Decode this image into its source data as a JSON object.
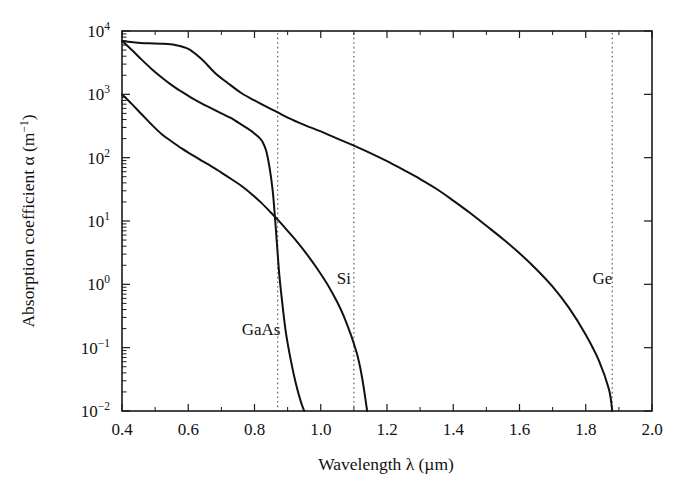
{
  "chart_data": {
    "type": "line",
    "title": "",
    "xlabel": "Wavelength λ (µm)",
    "ylabel": "Absorption coefficient α (m⁻¹)",
    "xlim": [
      0.4,
      2.0
    ],
    "ylim": [
      0.01,
      10000
    ],
    "yscale": "log",
    "xscale": "linear",
    "grid": false,
    "legend": "inline-labels",
    "xticks": [
      "0.4",
      "0.6",
      "0.8",
      "1.0",
      "1.2",
      "1.4",
      "1.6",
      "1.8",
      "2.0"
    ],
    "xtick_values": [
      0.4,
      0.6,
      0.8,
      1.0,
      1.2,
      1.4,
      1.6,
      1.8,
      2.0
    ],
    "yticks": [
      "10⁴",
      "10³",
      "10²",
      "10¹",
      "10⁰",
      "10⁻¹",
      "10⁻²"
    ],
    "ytick_bases": [
      "10",
      "10",
      "10",
      "10",
      "10",
      "10",
      "10"
    ],
    "ytick_exponents": [
      "4",
      "3",
      "2",
      "1",
      "0",
      "-1",
      "-2"
    ],
    "ytick_values": [
      10000,
      1000,
      100,
      10,
      1,
      0.1,
      0.01
    ],
    "annotations": [
      {
        "text": "GaAs",
        "x": 0.82,
        "y": 0.16,
        "kind": "curve-label"
      },
      {
        "text": "Si",
        "x": 1.07,
        "y": 1.0,
        "kind": "curve-label"
      },
      {
        "text": "Ge",
        "x": 1.85,
        "y": 1.0,
        "kind": "curve-label"
      }
    ],
    "bandgap_cutoffs": [
      {
        "material": "GaAs",
        "wavelength": 0.87
      },
      {
        "material": "Si",
        "wavelength": 1.1
      },
      {
        "material": "Ge",
        "wavelength": 1.88
      }
    ],
    "series": [
      {
        "name": "Ge",
        "points": [
          [
            0.4,
            7000
          ],
          [
            0.44,
            6600
          ],
          [
            0.48,
            6400
          ],
          [
            0.52,
            6300
          ],
          [
            0.56,
            6000
          ],
          [
            0.6,
            5200
          ],
          [
            0.64,
            3600
          ],
          [
            0.68,
            2200
          ],
          [
            0.72,
            1500
          ],
          [
            0.76,
            1050
          ],
          [
            0.8,
            800
          ],
          [
            0.84,
            620
          ],
          [
            0.87,
            520
          ],
          [
            0.9,
            430
          ],
          [
            0.95,
            330
          ],
          [
            1.0,
            260
          ],
          [
            1.05,
            200
          ],
          [
            1.1,
            155
          ],
          [
            1.15,
            118
          ],
          [
            1.2,
            88
          ],
          [
            1.25,
            64
          ],
          [
            1.3,
            46
          ],
          [
            1.35,
            32
          ],
          [
            1.4,
            21
          ],
          [
            1.45,
            13.5
          ],
          [
            1.5,
            8.4
          ],
          [
            1.55,
            5.2
          ],
          [
            1.6,
            3.1
          ],
          [
            1.65,
            1.75
          ],
          [
            1.7,
            0.92
          ],
          [
            1.75,
            0.42
          ],
          [
            1.8,
            0.16
          ],
          [
            1.84,
            0.062
          ],
          [
            1.87,
            0.022
          ],
          [
            1.88,
            0.01
          ]
        ]
      },
      {
        "name": "GaAs",
        "points": [
          [
            0.4,
            7000
          ],
          [
            0.43,
            5000
          ],
          [
            0.46,
            3500
          ],
          [
            0.49,
            2500
          ],
          [
            0.52,
            1850
          ],
          [
            0.55,
            1400
          ],
          [
            0.58,
            1100
          ],
          [
            0.61,
            880
          ],
          [
            0.64,
            720
          ],
          [
            0.67,
            600
          ],
          [
            0.7,
            500
          ],
          [
            0.73,
            420
          ],
          [
            0.75,
            360
          ],
          [
            0.77,
            310
          ],
          [
            0.79,
            265
          ],
          [
            0.8,
            240
          ],
          [
            0.815,
            205
          ],
          [
            0.825,
            175
          ],
          [
            0.835,
            130
          ],
          [
            0.845,
            72
          ],
          [
            0.855,
            30
          ],
          [
            0.862,
            11
          ],
          [
            0.868,
            4.2
          ],
          [
            0.875,
            1.4
          ],
          [
            0.885,
            0.45
          ],
          [
            0.895,
            0.17
          ],
          [
            0.91,
            0.062
          ],
          [
            0.925,
            0.027
          ],
          [
            0.94,
            0.014
          ],
          [
            0.95,
            0.01
          ]
        ]
      },
      {
        "name": "Si",
        "points": [
          [
            0.4,
            1000
          ],
          [
            0.43,
            700
          ],
          [
            0.46,
            480
          ],
          [
            0.49,
            330
          ],
          [
            0.52,
            235
          ],
          [
            0.55,
            180
          ],
          [
            0.58,
            140
          ],
          [
            0.61,
            112
          ],
          [
            0.64,
            90
          ],
          [
            0.67,
            73
          ],
          [
            0.7,
            58
          ],
          [
            0.73,
            46
          ],
          [
            0.76,
            36
          ],
          [
            0.79,
            27
          ],
          [
            0.82,
            19.5
          ],
          [
            0.85,
            13.5
          ],
          [
            0.87,
            10.5
          ],
          [
            0.9,
            7.0
          ],
          [
            0.93,
            4.6
          ],
          [
            0.96,
            2.9
          ],
          [
            0.99,
            1.75
          ],
          [
            1.02,
            1.0
          ],
          [
            1.05,
            0.52
          ],
          [
            1.07,
            0.31
          ],
          [
            1.09,
            0.165
          ],
          [
            1.1,
            0.115
          ],
          [
            1.11,
            0.078
          ],
          [
            1.12,
            0.046
          ],
          [
            1.13,
            0.023
          ],
          [
            1.14,
            0.01
          ]
        ]
      }
    ]
  },
  "axes": {
    "x_title_text": "Wavelength λ (µm)",
    "y_title_prefix": "Absorption coefficient α (m",
    "y_title_exp": "−1",
    "y_title_suffix": ")"
  }
}
